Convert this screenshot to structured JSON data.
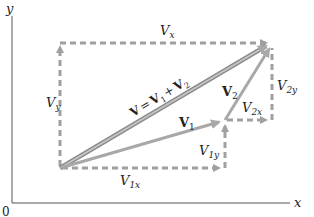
{
  "diagram": {
    "axes": {
      "x_label": "x",
      "y_label": "y",
      "origin_label": "0"
    },
    "colors": {
      "vector": "#a8a8a8",
      "resultant_outline": "#8a8a8a",
      "dashed": "#a0a0a0",
      "axis": "#555555",
      "text": "#222222"
    },
    "vectors": {
      "resultant": {
        "symbol": "V",
        "eq": "=",
        "v1": "V",
        "v1_sub": "1",
        "plus": "+",
        "v2": "V",
        "v2_sub": "2"
      },
      "v1": {
        "symbol": "V",
        "sub": "1"
      },
      "v2": {
        "symbol": "V",
        "sub": "2"
      }
    },
    "components": {
      "vx": {
        "symbol": "V",
        "sub": "x"
      },
      "vy": {
        "symbol": "V",
        "sub": "y"
      },
      "v1x": {
        "symbol": "V",
        "sub": "1x"
      },
      "v1y": {
        "symbol": "V",
        "sub": "1y"
      },
      "v2x": {
        "symbol": "V",
        "sub": "2x"
      },
      "v2y": {
        "symbol": "V",
        "sub": "2y"
      }
    }
  }
}
